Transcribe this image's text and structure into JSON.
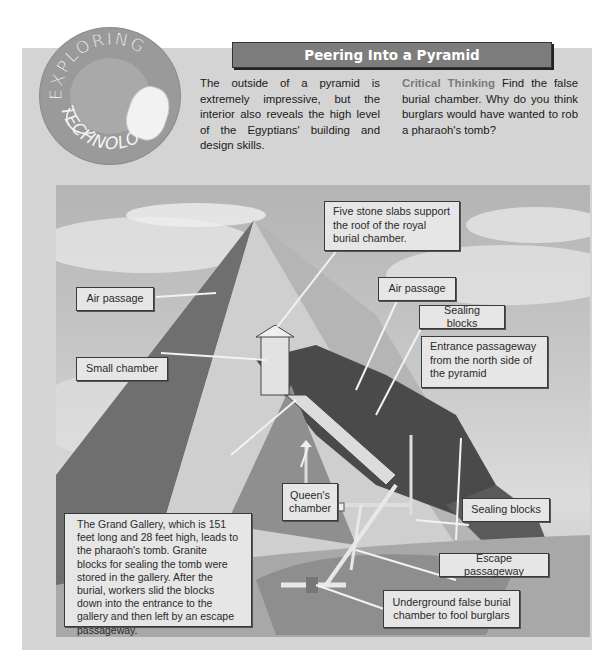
{
  "badge": {
    "top_text": "EXPLORING",
    "bottom_text": "TECHNOLOGY",
    "icon": "computer-mouse-icon"
  },
  "header": {
    "title": "Peering Into a Pyramid"
  },
  "intro": {
    "text": "The outside of a pyramid is extremely impressive, but the interior also reveals the high level of the Egyptians' building and design skills."
  },
  "critical_thinking": {
    "lead": "Critical Thinking",
    "text": " Find the false burial chamber. Why do you think burglars would have wanted to rob a pharaoh's tomb?"
  },
  "illustration": {
    "labels": {
      "five_slabs": "Five stone slabs support the roof of the royal burial chamber.",
      "air_passage_right": "Air passage",
      "sealing_blocks_upper": "Sealing blocks",
      "air_passage_left": "Air passage",
      "entrance_passageway": "Entrance passageway from the north side of the pyramid",
      "small_chamber": "Small chamber",
      "queens_chamber": "Queen's chamber",
      "sealing_blocks_lower": "Sealing blocks",
      "grand_gallery": "The Grand Gallery, which is 151 feet long and 28 feet high, leads to the pharaoh's tomb. Granite blocks for sealing the tomb were stored in the gallery. After the burial, workers slid the blocks down into the entrance to the gallery and then left by an escape passageway.",
      "escape_passageway": "Escape passageway",
      "false_burial": "Underground false burial chamber to fool burglars"
    }
  },
  "colors": {
    "panel": "#d4d4d4",
    "header_bar": "#7d7d7d",
    "label_bg": "#e6e6e6",
    "critical_lead": "#7a7a7a"
  }
}
